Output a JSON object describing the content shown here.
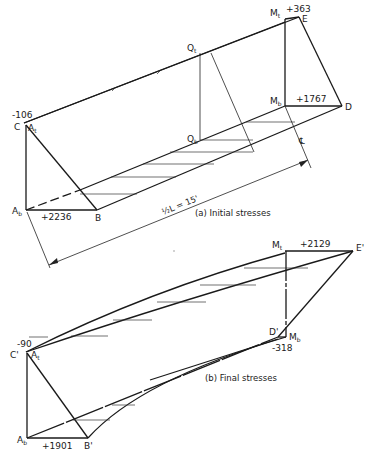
{
  "figure": {
    "panel_a": {
      "caption": "(a) Initial stresses",
      "dimension_label": "½L = 15'",
      "centerline_symbol": "℄",
      "points": {
        "C": "C",
        "A_t": "A",
        "A_t_sub": "t",
        "A_b": "A",
        "A_b_sub": "b",
        "B": "B",
        "Q_t": "Q",
        "Q_t_sub": "t",
        "Q_b": "Q",
        "Q_b_sub": "b",
        "M_t": "M",
        "M_t_sub": "t",
        "M_b": "M",
        "M_b_sub": "b",
        "D": "D",
        "E": "E"
      },
      "values": {
        "top_support": "-106",
        "bottom_support": "+2236",
        "top_midspan": "+363",
        "bottom_midspan": "+1767"
      }
    },
    "panel_b": {
      "caption": "(b) Final stresses",
      "points": {
        "C_prime": "C'",
        "A_t": "A",
        "A_t_sub": "t",
        "A_b": "A",
        "A_b_sub": "b",
        "B_prime": "B'",
        "M_t": "M",
        "M_t_sub": "t",
        "M_b": "M",
        "M_b_sub": "b",
        "D_prime": "D'",
        "E_prime": "E'"
      },
      "values": {
        "top_support": "-90",
        "bottom_support": "+1901",
        "top_midspan": "+2129",
        "bottom_midspan": "-318"
      }
    },
    "colors": {
      "line": "#1a1a1a",
      "background": "#ffffff"
    }
  }
}
